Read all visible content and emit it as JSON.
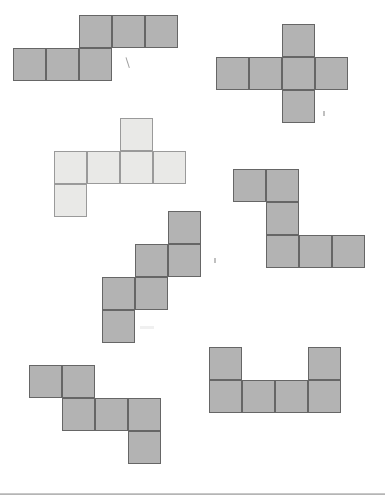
{
  "page": {
    "background_color": "#ffffff",
    "width": 385,
    "height": 499
  },
  "palette": {
    "dark_fill": "#b3b3b3",
    "dark_stroke": "#666666",
    "light_fill": "#e9e9e7",
    "light_stroke": "#9a9a9a",
    "rule": "#c8c8c8"
  },
  "geometry": {
    "cell_size": 33,
    "unit_note": "pixels"
  },
  "figures": [
    {
      "id": "figure-1",
      "name": "z-shaped-net-top-left",
      "shade": "dark",
      "cell": 33,
      "origin_x": 13,
      "origin_y": 15,
      "cells": [
        {
          "col": 2,
          "row": 0
        },
        {
          "col": 3,
          "row": 0
        },
        {
          "col": 4,
          "row": 0
        },
        {
          "col": 0,
          "row": 1
        },
        {
          "col": 1,
          "row": 1
        },
        {
          "col": 2,
          "row": 1
        }
      ]
    },
    {
      "id": "figure-2",
      "name": "cross-shaped-net-top-right",
      "shade": "dark",
      "cell": 33,
      "origin_x": 216,
      "origin_y": 24,
      "cells": [
        {
          "col": 2,
          "row": 0
        },
        {
          "col": 0,
          "row": 1
        },
        {
          "col": 1,
          "row": 1
        },
        {
          "col": 2,
          "row": 1
        },
        {
          "col": 3,
          "row": 1
        },
        {
          "col": 2,
          "row": 2
        }
      ]
    },
    {
      "id": "figure-3",
      "name": "t-shaped-net-middle-left-light",
      "shade": "light",
      "cell": 33,
      "origin_x": 54,
      "origin_y": 118,
      "cells": [
        {
          "col": 2,
          "row": 0
        },
        {
          "col": 0,
          "row": 1
        },
        {
          "col": 1,
          "row": 1
        },
        {
          "col": 2,
          "row": 1
        },
        {
          "col": 3,
          "row": 1
        },
        {
          "col": 0,
          "row": 2
        }
      ]
    },
    {
      "id": "figure-4",
      "name": "staircase-net-center",
      "shade": "dark",
      "cell": 33,
      "origin_x": 102,
      "origin_y": 211,
      "cells": [
        {
          "col": 2,
          "row": 0
        },
        {
          "col": 1,
          "row": 1
        },
        {
          "col": 2,
          "row": 1
        },
        {
          "col": 0,
          "row": 2
        },
        {
          "col": 1,
          "row": 2
        },
        {
          "col": 0,
          "row": 3
        }
      ]
    },
    {
      "id": "figure-5",
      "name": "z-shaped-net-middle-right",
      "shade": "dark",
      "cell": 33,
      "origin_x": 233,
      "origin_y": 169,
      "cells": [
        {
          "col": 0,
          "row": 0
        },
        {
          "col": 1,
          "row": 0
        },
        {
          "col": 1,
          "row": 1
        },
        {
          "col": 1,
          "row": 2
        },
        {
          "col": 2,
          "row": 2
        },
        {
          "col": 3,
          "row": 2
        }
      ]
    },
    {
      "id": "figure-6",
      "name": "zigzag-net-bottom-left",
      "shade": "dark",
      "cell": 33,
      "origin_x": 29,
      "origin_y": 365,
      "cells": [
        {
          "col": 0,
          "row": 0
        },
        {
          "col": 1,
          "row": 0
        },
        {
          "col": 1,
          "row": 1
        },
        {
          "col": 2,
          "row": 1
        },
        {
          "col": 3,
          "row": 1
        },
        {
          "col": 3,
          "row": 2
        }
      ]
    },
    {
      "id": "figure-7",
      "name": "u-shaped-net-bottom-right",
      "shade": "dark",
      "cell": 33,
      "origin_x": 209,
      "origin_y": 347,
      "cells": [
        {
          "col": 0,
          "row": 0
        },
        {
          "col": 3,
          "row": 0
        },
        {
          "col": 0,
          "row": 1
        },
        {
          "col": 1,
          "row": 1
        },
        {
          "col": 2,
          "row": 1
        },
        {
          "col": 3,
          "row": 1
        }
      ]
    }
  ],
  "marks": [
    {
      "id": "mark-1",
      "name": "pencil-tick-mark",
      "type": "tick",
      "x": 127,
      "y": 56
    },
    {
      "id": "mark-2",
      "name": "faint-dot-mark",
      "type": "dot",
      "x": 323,
      "y": 111
    },
    {
      "id": "mark-3",
      "name": "faint-dot-mark",
      "type": "dot",
      "x": 214,
      "y": 258
    },
    {
      "id": "mark-4",
      "name": "scan-smudge",
      "type": "smudge",
      "x": 140,
      "y": 326
    }
  ],
  "rules": [
    {
      "id": "rule-1",
      "name": "page-bottom-rule",
      "y": 493,
      "shade": false
    },
    {
      "id": "rule-2",
      "name": "page-bottom-rule-shadow",
      "y": 494,
      "shade": true
    }
  ]
}
